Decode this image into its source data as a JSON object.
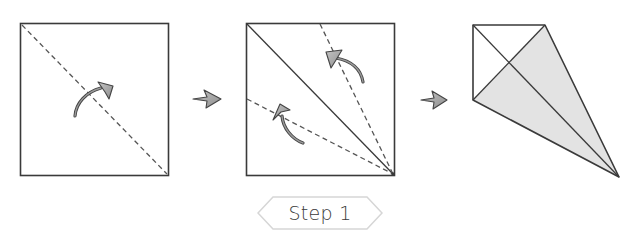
{
  "step_label": "Step 1",
  "colors": {
    "line": "#3a3a3a",
    "dashed": "#555555",
    "arrow_fill": "#aaaaaa",
    "arrow_stroke": "#444444",
    "shaded_fill": "#e3e3e3",
    "label_border": "#d8d8d8"
  },
  "panels": [
    {
      "id": "panel-1",
      "description": "Square paper with diagonal dashed fold line; fold arrow across diagonal"
    },
    {
      "id": "panel-2",
      "description": "Square with solid diagonal crease; two dashed lines from bottom-right corner to top edge and left edge; two fold arrows folding edges to diagonal"
    },
    {
      "id": "panel-3",
      "description": "Result: kite shape with shaded folded flaps"
    }
  ]
}
